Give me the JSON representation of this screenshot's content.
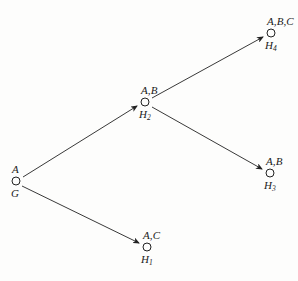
{
  "diagram": {
    "background_color": "#fdfdfc",
    "line_color": "#222222",
    "text_color": "#1a1a1a",
    "nodes": [
      {
        "id": "G",
        "name": "root-node-g",
        "top_label": "A",
        "bottom_label": "G",
        "cx": 16,
        "cy": 181,
        "r": 4
      },
      {
        "id": "H2",
        "name": "node-h2",
        "top_label": "A,B",
        "bottom_label": "H",
        "bottom_sub": "2",
        "cx": 145,
        "cy": 102,
        "r": 4
      },
      {
        "id": "H4",
        "name": "node-h4",
        "top_label": "A,B,C",
        "bottom_label": "H",
        "bottom_sub": "4",
        "cx": 271,
        "cy": 33,
        "r": 4
      },
      {
        "id": "H3",
        "name": "node-h3",
        "top_label": "A,B",
        "bottom_label": "H",
        "bottom_sub": "3",
        "cx": 270,
        "cy": 173,
        "r": 4
      },
      {
        "id": "H1",
        "name": "node-h1",
        "top_label": "A,C",
        "bottom_label": "H",
        "bottom_sub": "1",
        "cx": 147,
        "cy": 247,
        "r": 4
      }
    ],
    "edges": [
      {
        "name": "edge-g-to-h2",
        "from": "G",
        "to": "H2",
        "x1": 23,
        "y1": 177,
        "x2": 137,
        "y2": 106,
        "arrow": true
      },
      {
        "name": "edge-g-to-h1",
        "from": "G",
        "to": "H1",
        "x1": 22,
        "y1": 186,
        "x2": 139,
        "y2": 243,
        "arrow": true
      },
      {
        "name": "edge-h2-to-h4",
        "from": "H2",
        "to": "H4",
        "x1": 152,
        "y1": 98,
        "x2": 263,
        "y2": 37,
        "arrow": true
      },
      {
        "name": "edge-h2-to-h3",
        "from": "H2",
        "to": "H3",
        "x1": 152,
        "y1": 107,
        "x2": 262,
        "y2": 169,
        "arrow": true
      }
    ]
  }
}
